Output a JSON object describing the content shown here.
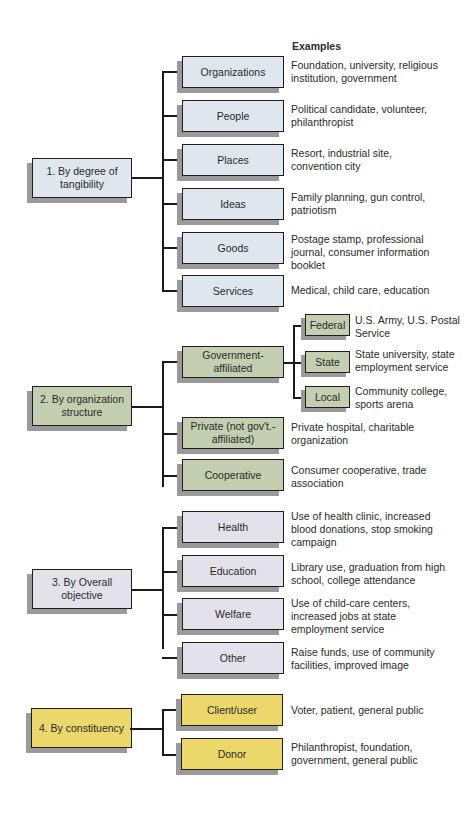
{
  "header": "Examples",
  "groups": [
    {
      "label": "1. By degree of tangibility",
      "color": "#dfe6ee",
      "items": [
        {
          "label": "Organizations",
          "example": "Foundation, university, religious institution, government"
        },
        {
          "label": "People",
          "example": "Political candidate, volunteer, philanthropist"
        },
        {
          "label": "Places",
          "example": "Resort, industrial site, convention city"
        },
        {
          "label": "Ideas",
          "example": "Family planning, gun control, patriotism"
        },
        {
          "label": "Goods",
          "example": "Postage stamp, professional journal, consumer information booklet"
        },
        {
          "label": "Services",
          "example": "Medical, child care, education"
        }
      ]
    },
    {
      "label": "2. By organization structure",
      "color": "#c3cfb0",
      "items": [
        {
          "label": "Government-affiliated",
          "children": [
            {
              "label": "Federal",
              "example": "U.S. Army, U.S. Postal Service"
            },
            {
              "label": "State",
              "example": "State university, state employment service"
            },
            {
              "label": "Local",
              "example": "Community college, sports arena"
            }
          ]
        },
        {
          "label": "Private (not gov't.-affiliated)",
          "example": "Private hospital, charitable organization"
        },
        {
          "label": "Cooperative",
          "example": "Consumer cooperative, trade association"
        }
      ]
    },
    {
      "label": "3. By Overall objective",
      "color": "#e3e2ea",
      "items": [
        {
          "label": "Health",
          "example": "Use of health clinic, increased blood donations, stop smoking campaign"
        },
        {
          "label": "Education",
          "example": "Library use, graduation from high school, college attendance"
        },
        {
          "label": "Welfare",
          "example": "Use of child-care centers, increased jobs at state employment service"
        },
        {
          "label": "Other",
          "example": "Raise funds, use of community facilities, improved image"
        }
      ]
    },
    {
      "label": "4. By constituency",
      "color": "#ecd86a",
      "items": [
        {
          "label": "Client/user",
          "example": "Voter, patient, general public"
        },
        {
          "label": "Donor",
          "example": "Philanthropist, foundation, government, general public"
        }
      ]
    }
  ]
}
